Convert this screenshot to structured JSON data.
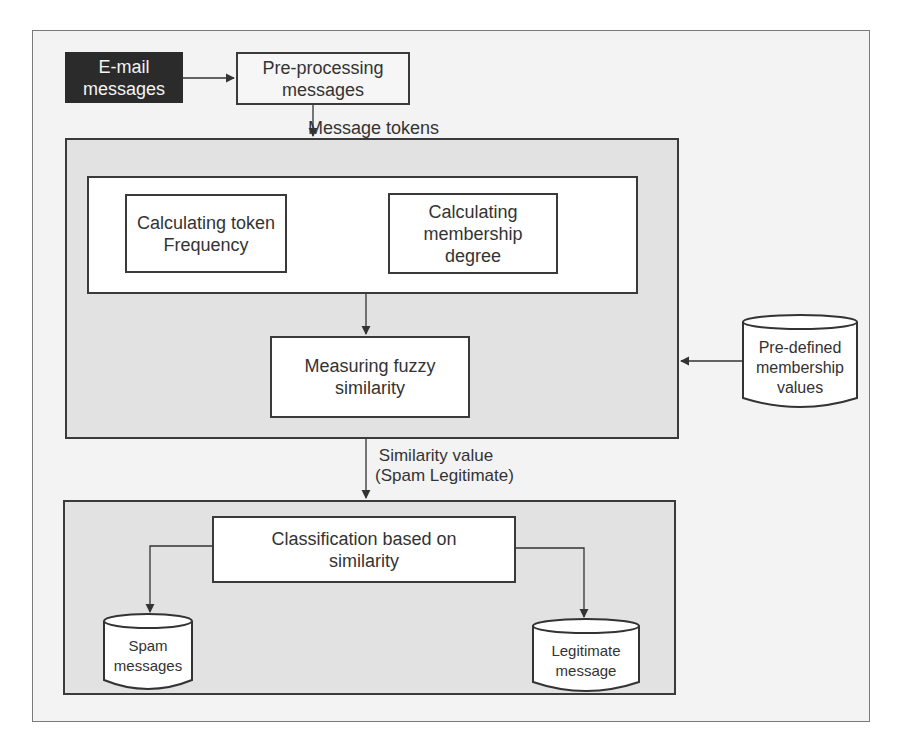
{
  "diagram": {
    "nodes": {
      "email": {
        "label_line1": "E-mail",
        "label_line2": "messages"
      },
      "preprocess": {
        "label_line1": "Pre-processing",
        "label_line2": "messages"
      },
      "token_freq": {
        "label_line1": "Calculating token",
        "label_line2": "Frequency"
      },
      "membership": {
        "label_line1": "Calculating",
        "label_line2": "membership",
        "label_line3": "degree"
      },
      "fuzzy": {
        "label_line1": "Measuring fuzzy",
        "label_line2": "similarity"
      },
      "predefined": {
        "label_line1": "Pre-defined",
        "label_line2": "membership",
        "label_line3": "values"
      },
      "classification": {
        "label_line1": "Classification based on",
        "label_line2": "similarity"
      },
      "spam": {
        "label_line1": "Spam",
        "label_line2": "messages"
      },
      "legit": {
        "label_line1": "Legitimate",
        "label_line2": "message"
      }
    },
    "edges": {
      "message_tokens": "Message tokens",
      "similarity_line1": "Similarity value",
      "similarity_line2": "(Spam Legitimate)"
    },
    "colors": {
      "dark_box": "#2b2b2b",
      "panel_fill": "#e2e2e2",
      "frame_fill": "#f3f3f3",
      "stroke": "#3a3a3a"
    }
  }
}
